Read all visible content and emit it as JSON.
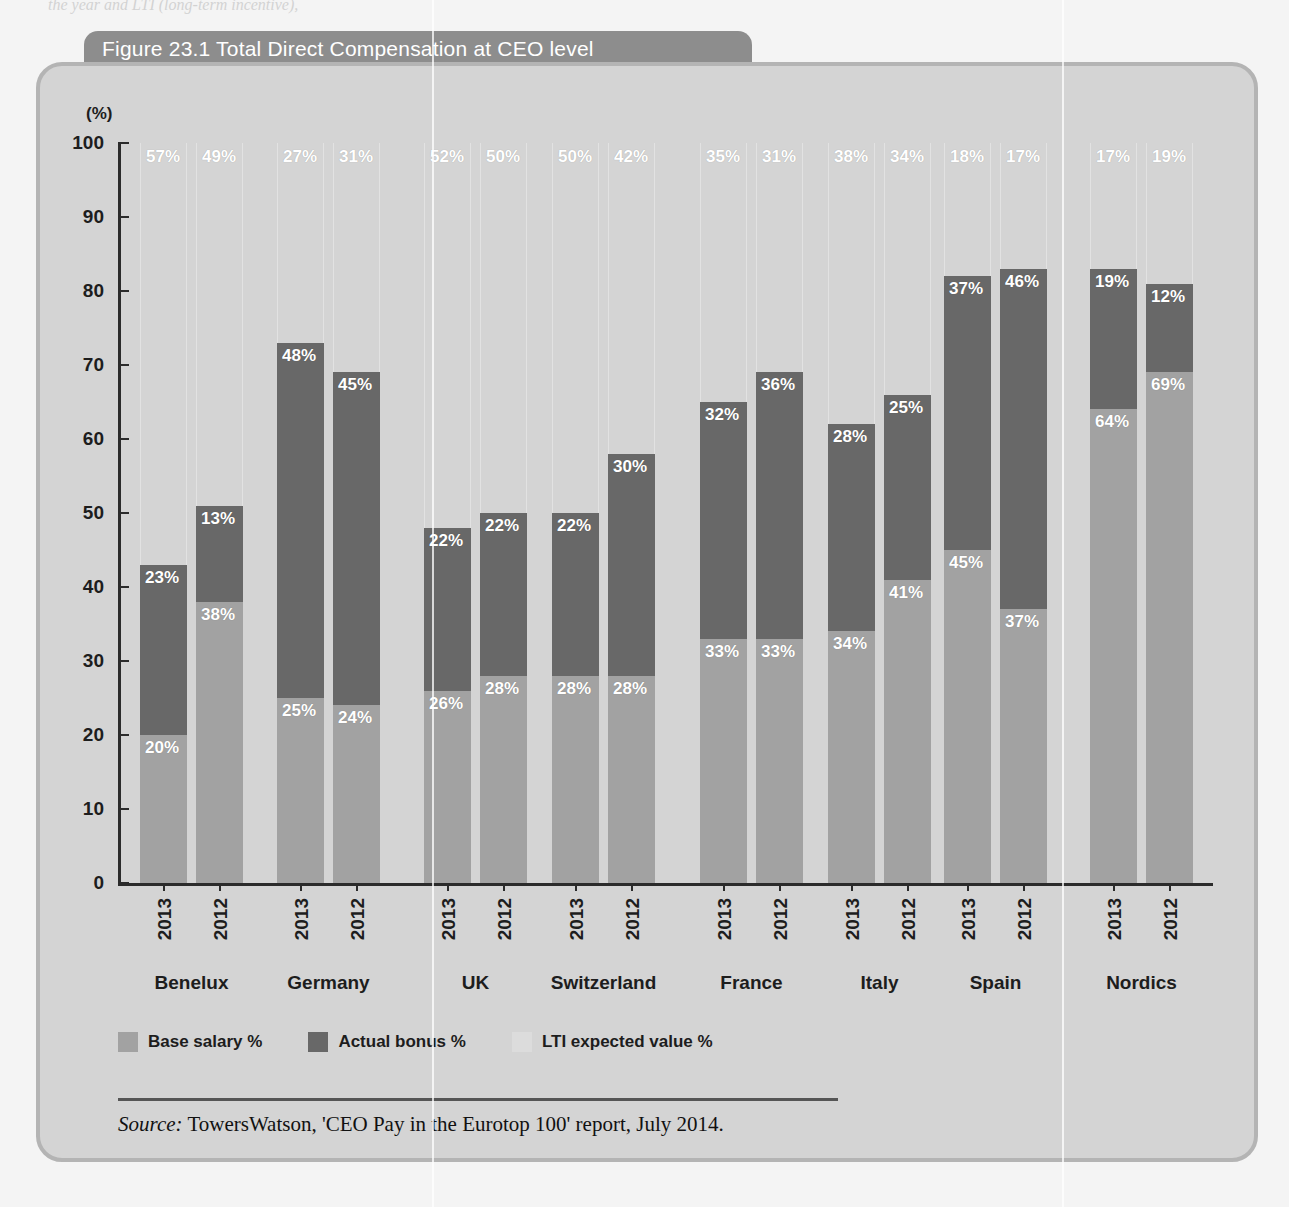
{
  "top_text_fragment": "the year and LTI (long-term incentive),",
  "figure": {
    "title": "Figure 23.1 Total Direct Compensation at CEO level",
    "y_axis_unit": "(%)",
    "source_label": "Source:",
    "source_text": " TowersWatson, 'CEO Pay in the Eurotop 100' report, July 2014."
  },
  "legend": {
    "items": [
      {
        "label": "Base salary %",
        "swatch": "base-salary-swatch",
        "color": "#a2a2a2"
      },
      {
        "label": "Actual bonus %",
        "swatch": "actual-bonus-swatch",
        "color": "#686868"
      },
      {
        "label": "LTI expected value %",
        "swatch": "lti-swatch",
        "color": "#dcdcdc"
      }
    ]
  },
  "chart_data": {
    "type": "bar",
    "subtype": "stacked-100",
    "title": "Figure 23.1 Total Direct Compensation at CEO level",
    "xlabel": "",
    "ylabel": "(%)",
    "ylim": [
      0,
      100
    ],
    "yticks": [
      0,
      10,
      20,
      30,
      40,
      50,
      60,
      70,
      80,
      90,
      100
    ],
    "grid": false,
    "legend_position": "bottom-left",
    "categories": [
      "Benelux",
      "Germany",
      "UK",
      "Switzerland",
      "France",
      "Italy",
      "Spain",
      "Nordics"
    ],
    "subcategories": [
      "2013",
      "2012"
    ],
    "series": [
      {
        "name": "Base salary %",
        "color": "#a2a2a2",
        "values": {
          "Benelux": {
            "2013": 20,
            "2012": 38
          },
          "Germany": {
            "2013": 25,
            "2012": 24
          },
          "UK": {
            "2013": 26,
            "2012": 28
          },
          "Switzerland": {
            "2013": 28,
            "2012": 28
          },
          "France": {
            "2013": 33,
            "2012": 33
          },
          "Italy": {
            "2013": 34,
            "2012": 41
          },
          "Spain": {
            "2013": 45,
            "2012": 37
          },
          "Nordics": {
            "2013": 64,
            "2012": 69
          }
        }
      },
      {
        "name": "Actual bonus %",
        "color": "#686868",
        "values": {
          "Benelux": {
            "2013": 23,
            "2012": 13
          },
          "Germany": {
            "2013": 48,
            "2012": 45
          },
          "UK": {
            "2013": 22,
            "2012": 22
          },
          "Switzerland": {
            "2013": 22,
            "2012": 30
          },
          "France": {
            "2013": 32,
            "2012": 36
          },
          "Italy": {
            "2013": 28,
            "2012": 25
          },
          "Spain": {
            "2013": 37,
            "2012": 46
          },
          "Nordics": {
            "2013": 19,
            "2012": 12
          }
        }
      },
      {
        "name": "LTI expected value %",
        "color": "#dcdcdc",
        "values": {
          "Benelux": {
            "2013": 57,
            "2012": 49
          },
          "Germany": {
            "2013": 27,
            "2012": 31
          },
          "UK": {
            "2013": 52,
            "2012": 50
          },
          "Switzerland": {
            "2013": 50,
            "2012": 42
          },
          "France": {
            "2013": 35,
            "2012": 31
          },
          "Italy": {
            "2013": 38,
            "2012": 34
          },
          "Spain": {
            "2013": 18,
            "2012": 17
          },
          "Nordics": {
            "2013": 17,
            "2012": 19
          }
        }
      }
    ]
  }
}
